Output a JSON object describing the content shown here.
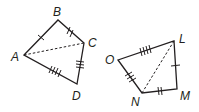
{
  "diagram": {
    "figure1": {
      "vertices": {
        "A": "A",
        "B": "B",
        "C": "C",
        "D": "D"
      },
      "sides": [
        {
          "from": "A",
          "to": "B",
          "ticks": 1
        },
        {
          "from": "B",
          "to": "C",
          "ticks": 2
        },
        {
          "from": "C",
          "to": "D",
          "ticks": 3
        },
        {
          "from": "D",
          "to": "A",
          "ticks": 4
        }
      ],
      "diagonal": {
        "from": "A",
        "to": "C",
        "style": "dashed"
      }
    },
    "figure2": {
      "vertices": {
        "L": "L",
        "M": "M",
        "N": "N",
        "O": "O"
      },
      "sides": [
        {
          "from": "L",
          "to": "M",
          "ticks": 1
        },
        {
          "from": "M",
          "to": "N",
          "ticks": 2
        },
        {
          "from": "N",
          "to": "O",
          "ticks": 3
        },
        {
          "from": "O",
          "to": "L",
          "ticks": 4
        }
      ],
      "diagonal": {
        "from": "L",
        "to": "N",
        "style": "dashed"
      }
    },
    "colors": {
      "stroke": "#231f20",
      "background": "#ffffff"
    }
  }
}
